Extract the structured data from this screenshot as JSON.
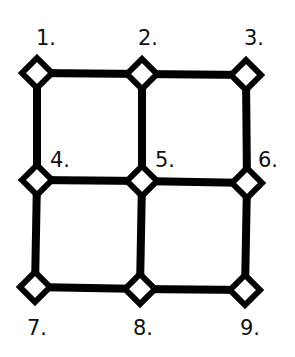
{
  "diagram": {
    "type": "grid-graph",
    "rows": 3,
    "cols": 3,
    "background": "#ffffff",
    "stroke_color": "#000000",
    "node_fill": "#ffffff",
    "nodes": [
      {
        "id": 1,
        "label": "1.",
        "x": 37,
        "y": 73,
        "label_x": 36,
        "label_y": 45,
        "label_pos": "above"
      },
      {
        "id": 2,
        "label": "2.",
        "x": 142,
        "y": 74,
        "label_x": 138,
        "label_y": 45,
        "label_pos": "above"
      },
      {
        "id": 3,
        "label": "3.",
        "x": 246,
        "y": 75,
        "label_x": 244,
        "label_y": 45,
        "label_pos": "above"
      },
      {
        "id": 4,
        "label": "4.",
        "x": 37,
        "y": 180,
        "label_x": 50,
        "label_y": 167,
        "label_pos": "upper-right"
      },
      {
        "id": 5,
        "label": "5.",
        "x": 142,
        "y": 181,
        "label_x": 155,
        "label_y": 167,
        "label_pos": "upper-right"
      },
      {
        "id": 6,
        "label": "6.",
        "x": 247,
        "y": 183,
        "label_x": 258,
        "label_y": 167,
        "label_pos": "upper-right"
      },
      {
        "id": 7,
        "label": "7.",
        "x": 35,
        "y": 287,
        "label_x": 27,
        "label_y": 335,
        "label_pos": "below"
      },
      {
        "id": 8,
        "label": "8.",
        "x": 140,
        "y": 289,
        "label_x": 133,
        "label_y": 335,
        "label_pos": "below"
      },
      {
        "id": 9,
        "label": "9.",
        "x": 245,
        "y": 290,
        "label_x": 240,
        "label_y": 335,
        "label_pos": "below"
      }
    ],
    "edges": [
      [
        1,
        2
      ],
      [
        2,
        3
      ],
      [
        4,
        5
      ],
      [
        5,
        6
      ],
      [
        7,
        8
      ],
      [
        8,
        9
      ],
      [
        1,
        4
      ],
      [
        4,
        7
      ],
      [
        2,
        5
      ],
      [
        5,
        8
      ],
      [
        3,
        6
      ],
      [
        6,
        9
      ]
    ]
  }
}
